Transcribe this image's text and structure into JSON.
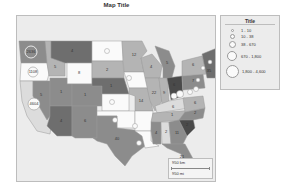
{
  "title": "Map Title",
  "legend": {
    "title": "Title",
    "items": [
      {
        "label": "1 - 10",
        "size": 3
      },
      {
        "label": "10 - 38",
        "size": 5
      },
      {
        "label": "38 - 670",
        "size": 7
      },
      {
        "label": "670 - 1,800",
        "size": 10
      },
      {
        "label": "1,800 - 4,600",
        "size": 13
      }
    ]
  },
  "scale": {
    "km_label": "950 km",
    "mi_label": "950 mi"
  },
  "colors": {
    "dark": "#6e6e6e",
    "mid": "#8c8c8c",
    "light": "#b4b4b4",
    "white": "#fafafa",
    "background": "#ececec"
  },
  "states": [
    {
      "name": "WA",
      "value": "2636"
    },
    {
      "name": "OR",
      "value": "1108"
    },
    {
      "name": "CA",
      "value": "4604"
    },
    {
      "name": "MT",
      "value": "4"
    },
    {
      "name": "ID",
      "value": "5"
    },
    {
      "name": "WY",
      "value": "8"
    },
    {
      "name": "NV",
      "value": "5"
    },
    {
      "name": "UT",
      "value": "1"
    },
    {
      "name": "CO",
      "value": "1"
    },
    {
      "name": "AZ",
      "value": "4"
    },
    {
      "name": "NM",
      "value": "6"
    },
    {
      "name": "ND",
      "value": ""
    },
    {
      "name": "SD",
      "value": "2"
    },
    {
      "name": "NE",
      "value": "1"
    },
    {
      "name": "KS",
      "value": ""
    },
    {
      "name": "OK",
      "value": ""
    },
    {
      "name": "TX",
      "value": "40"
    },
    {
      "name": "MN",
      "value": "12"
    },
    {
      "name": "IA",
      "value": ""
    },
    {
      "name": "MO",
      "value": "14"
    },
    {
      "name": "AR",
      "value": ""
    },
    {
      "name": "LA",
      "value": ""
    },
    {
      "name": "WI",
      "value": "4"
    },
    {
      "name": "IL",
      "value": "22"
    },
    {
      "name": "MI",
      "value": "5"
    },
    {
      "name": "IN",
      "value": "9"
    },
    {
      "name": "OH",
      "value": "6"
    },
    {
      "name": "KY",
      "value": "6"
    },
    {
      "name": "TN",
      "value": "1"
    },
    {
      "name": "MS",
      "value": "4"
    },
    {
      "name": "AL",
      "value": "2"
    },
    {
      "name": "GA",
      "value": "11"
    },
    {
      "name": "FL",
      "value": "21"
    },
    {
      "name": "SC",
      "value": "2"
    },
    {
      "name": "NC",
      "value": "2"
    },
    {
      "name": "VA",
      "value": "6"
    },
    {
      "name": "PA",
      "value": "7"
    },
    {
      "name": "NY",
      "value": "6"
    },
    {
      "name": "NE-region",
      "value": "35"
    }
  ]
}
